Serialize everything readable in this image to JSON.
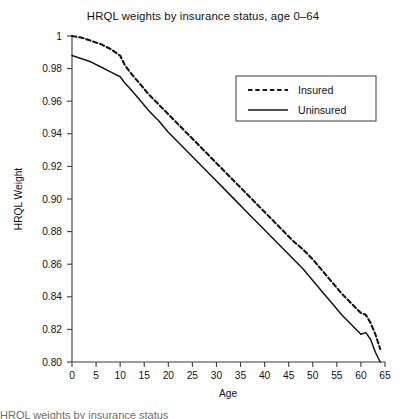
{
  "chart_data": {
    "type": "line",
    "title": "HRQL weights by insurance status, age 0–64",
    "xlabel": "Age",
    "ylabel": "HRQL Weight",
    "xlim": [
      0,
      65
    ],
    "ylim": [
      0.8,
      1.0
    ],
    "grid": false,
    "legend_position": "upper right",
    "xticks": [
      0,
      5,
      10,
      15,
      20,
      25,
      30,
      35,
      40,
      45,
      50,
      55,
      60,
      65
    ],
    "xticklabels": [
      "0",
      "5",
      "10",
      "15",
      "20",
      "25",
      "30",
      "35",
      "40",
      "45",
      "50",
      "55",
      "60",
      "65"
    ],
    "yticks": [
      0.8,
      0.82,
      0.84,
      0.86,
      0.88,
      0.9,
      0.92,
      0.94,
      0.96,
      0.98,
      1.0
    ],
    "yticklabels": [
      "0.80",
      "0.82",
      "0.84",
      "0.86",
      "0.88",
      "0.90",
      "0.92",
      "0.94",
      "0.96",
      "0.98",
      "1"
    ],
    "x": [
      0,
      2,
      4,
      6,
      8,
      10,
      11,
      12,
      14,
      16,
      18,
      20,
      22,
      24,
      26,
      28,
      30,
      32,
      34,
      36,
      38,
      40,
      42,
      44,
      46,
      48,
      50,
      52,
      54,
      56,
      58,
      60,
      61,
      62,
      63,
      64
    ],
    "series": [
      {
        "name": "Insured",
        "style": "dashed",
        "color": "#141414",
        "values": [
          1.0,
          0.999,
          0.997,
          0.995,
          0.992,
          0.988,
          0.982,
          0.978,
          0.971,
          0.964,
          0.958,
          0.952,
          0.946,
          0.94,
          0.934,
          0.928,
          0.922,
          0.916,
          0.91,
          0.904,
          0.898,
          0.892,
          0.886,
          0.88,
          0.874,
          0.869,
          0.863,
          0.856,
          0.849,
          0.842,
          0.836,
          0.83,
          0.829,
          0.824,
          0.817,
          0.808
        ]
      },
      {
        "name": "Uninsured",
        "style": "solid",
        "color": "#141414",
        "values": [
          0.988,
          0.986,
          0.984,
          0.981,
          0.978,
          0.975,
          0.971,
          0.968,
          0.961,
          0.954,
          0.948,
          0.941,
          0.935,
          0.929,
          0.923,
          0.917,
          0.911,
          0.905,
          0.899,
          0.893,
          0.887,
          0.881,
          0.875,
          0.869,
          0.863,
          0.857,
          0.85,
          0.843,
          0.836,
          0.829,
          0.823,
          0.817,
          0.818,
          0.814,
          0.806,
          0.8
        ]
      }
    ]
  },
  "legend": {
    "entries": [
      {
        "label": "Insured",
        "style": "dashed"
      },
      {
        "label": "Uninsured",
        "style": "solid"
      }
    ]
  },
  "caption": {
    "text": "HRQL weights by insurance status"
  }
}
